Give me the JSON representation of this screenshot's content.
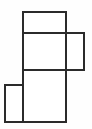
{
  "figure": {
    "title": "",
    "kind": "geometric-net-diagram",
    "background_color": "#fefefe",
    "stroke_color": "#2b2b2b",
    "stroke_width": 2,
    "fill_color": "#ffffff",
    "canvas": {
      "width": 92,
      "height": 129
    }
  },
  "chart_data": {
    "type": "diagram",
    "title": "",
    "xlabel": "",
    "ylabel": "",
    "xlim": [
      0,
      92
    ],
    "ylim": [
      0,
      129
    ],
    "grid": false,
    "legend": "none",
    "faces": [
      {
        "name": "top-face",
        "x": 23,
        "y": 12,
        "width": 43,
        "height": 21
      },
      {
        "name": "upper-middle-face",
        "x": 23,
        "y": 33,
        "width": 43,
        "height": 37
      },
      {
        "name": "right-face",
        "x": 66,
        "y": 33,
        "width": 18,
        "height": 37
      },
      {
        "name": "lower-middle-face",
        "x": 23,
        "y": 70,
        "width": 43,
        "height": 52
      },
      {
        "name": "left-face",
        "x": 5,
        "y": 85,
        "width": 18,
        "height": 37
      }
    ],
    "segments": [
      {
        "name": "top-face-top-edge",
        "x1": 23,
        "y1": 12,
        "x2": 66,
        "y2": 12
      },
      {
        "name": "top-face-left-edge",
        "x1": 23,
        "y1": 12,
        "x2": 23,
        "y2": 33
      },
      {
        "name": "top-face-right-edge",
        "x1": 66,
        "y1": 12,
        "x2": 66,
        "y2": 33
      },
      {
        "name": "first-horizontal-fold",
        "x1": 23,
        "y1": 33,
        "x2": 84,
        "y2": 33
      },
      {
        "name": "right-face-right-edge",
        "x1": 84,
        "y1": 33,
        "x2": 84,
        "y2": 70
      },
      {
        "name": "middle-column-left-edge",
        "x1": 23,
        "y1": 33,
        "x2": 23,
        "y2": 122
      },
      {
        "name": "middle-column-right-edge",
        "x1": 66,
        "y1": 12,
        "x2": 66,
        "y2": 122
      },
      {
        "name": "second-horizontal-fold",
        "x1": 23,
        "y1": 70,
        "x2": 84,
        "y2": 70
      },
      {
        "name": "left-face-top-edge",
        "x1": 5,
        "y1": 85,
        "x2": 23,
        "y2": 85
      },
      {
        "name": "left-face-left-edge",
        "x1": 5,
        "y1": 85,
        "x2": 5,
        "y2": 122
      },
      {
        "name": "bottom-edge",
        "x1": 5,
        "y1": 122,
        "x2": 66,
        "y2": 122
      }
    ]
  }
}
